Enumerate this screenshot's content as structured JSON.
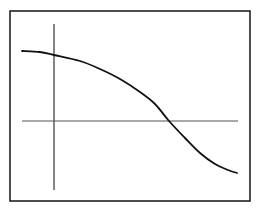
{
  "diagram": {
    "colors": {
      "background": "#ffffff",
      "frame": "#222222",
      "axes": "#333333",
      "curve": "#111111"
    },
    "frame": {
      "x": 10,
      "y": 11,
      "width": 240,
      "height": 190
    },
    "vertical_axis": {
      "x": 54,
      "y1": 24,
      "y2": 190
    },
    "horizontal_axis": {
      "y": 121,
      "x1": 22,
      "x2": 238
    },
    "curve_points": [
      [
        22,
        51
      ],
      [
        40,
        52
      ],
      [
        54,
        55
      ],
      [
        80,
        61
      ],
      [
        100,
        69
      ],
      [
        120,
        79
      ],
      [
        140,
        92
      ],
      [
        155,
        104
      ],
      [
        169,
        121
      ],
      [
        185,
        138
      ],
      [
        200,
        153
      ],
      [
        215,
        164
      ],
      [
        228,
        170
      ],
      [
        237,
        173
      ]
    ]
  }
}
